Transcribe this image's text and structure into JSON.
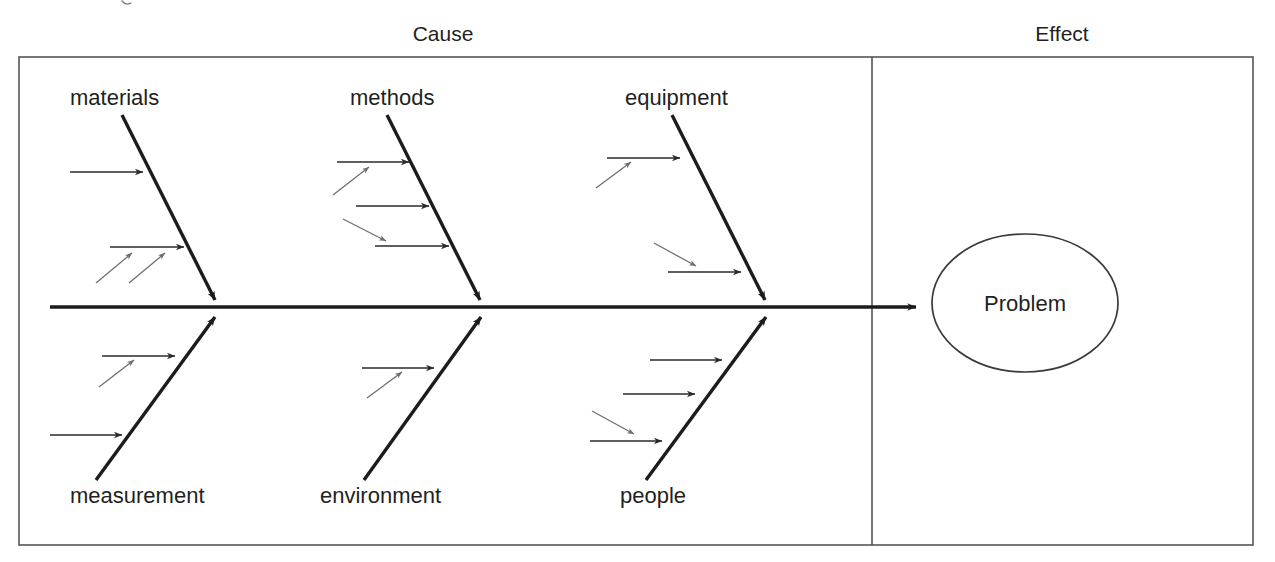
{
  "diagram": {
    "type": "fishbone-ishikawa-cause-and-effect",
    "headers": {
      "cause": "Cause",
      "effect": "Effect"
    },
    "effect_node": {
      "label": "Problem",
      "shape": "ellipse"
    },
    "categories_top": [
      {
        "id": "materials",
        "label": "materials",
        "position": "upper-left",
        "cause_arrow_count": 2,
        "sub_arrow_count": 2
      },
      {
        "id": "methods",
        "label": "methods",
        "position": "upper-middle",
        "cause_arrow_count": 3,
        "sub_arrow_count": 2
      },
      {
        "id": "equipment",
        "label": "equipment",
        "position": "upper-right",
        "cause_arrow_count": 2,
        "sub_arrow_count": 2
      }
    ],
    "categories_bottom": [
      {
        "id": "measurement",
        "label": "measurement",
        "position": "lower-left",
        "cause_arrow_count": 2,
        "sub_arrow_count": 1
      },
      {
        "id": "environment",
        "label": "environment",
        "position": "lower-middle",
        "cause_arrow_count": 1,
        "sub_arrow_count": 1
      },
      {
        "id": "people",
        "label": "people",
        "position": "lower-right",
        "cause_arrow_count": 3,
        "sub_arrow_count": 1
      }
    ],
    "colors": {
      "stroke_primary": "#1c1c1c",
      "stroke_secondary": "#2a2a2a",
      "stroke_faint": "#6d6d70",
      "frame": "#555558",
      "text": "#231f20",
      "background": "#ffffff"
    }
  }
}
